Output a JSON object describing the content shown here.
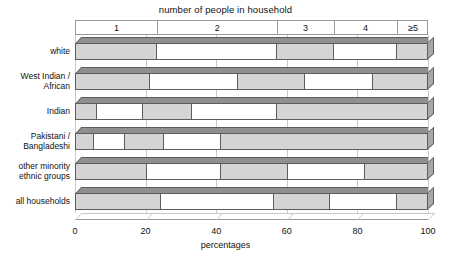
{
  "chart_data": {
    "type": "bar",
    "subtype": "stacked-horizontal-percentage",
    "title": "number of people in household",
    "xlabel": "percentages",
    "ylabel": "",
    "xlim": [
      0,
      100
    ],
    "xticks": [
      0,
      20,
      40,
      60,
      80,
      100
    ],
    "xtick_labels": [
      "0",
      "20",
      "40",
      "60",
      "80",
      "100"
    ],
    "grid": true,
    "legend_position": "top-axis-band",
    "series": [
      {
        "name": "1",
        "values": [
          23,
          21,
          6,
          5,
          20,
          24
        ]
      },
      {
        "name": "2",
        "values": [
          34,
          25,
          13,
          9,
          21,
          32
        ]
      },
      {
        "name": "3",
        "values": [
          16,
          19,
          14,
          11,
          19,
          16
        ]
      },
      {
        "name": "4",
        "values": [
          18,
          19,
          24,
          16,
          22,
          19
        ]
      },
      {
        "name": "≥5",
        "values": [
          9,
          16,
          43,
          59,
          18,
          9
        ]
      }
    ],
    "categories": [
      "white",
      "West Indian / African",
      "Indian",
      "Pakistani / Bangladeshi",
      "other minority ethnic groups",
      "all households"
    ],
    "colors": {
      "fill_segment": "#d4d4d4",
      "empty_segment": "#ffffff",
      "bar_outline": "#5d5d5d",
      "bar_top_face": "#8f8f8f",
      "bar_side_face": "#a8a8a8",
      "gridline": "#c9c9c9",
      "text": "#111111"
    }
  },
  "header": {
    "title": "number of people in household",
    "cells": [
      {
        "label": "1",
        "start": 0,
        "end": 23
      },
      {
        "label": "2",
        "start": 23,
        "end": 57
      },
      {
        "label": "3",
        "start": 57,
        "end": 73
      },
      {
        "label": "4",
        "start": 73,
        "end": 91
      },
      {
        "label": "≥5",
        "start": 91,
        "end": 100
      }
    ]
  },
  "rows": [
    {
      "label_lines": [
        "white"
      ],
      "segments": [
        {
          "value": 23,
          "start": 0,
          "end": 23,
          "filled": true
        },
        {
          "value": 34,
          "start": 23,
          "end": 57,
          "filled": false
        },
        {
          "value": 16,
          "start": 57,
          "end": 73,
          "filled": true
        },
        {
          "value": 18,
          "start": 73,
          "end": 91,
          "filled": false
        },
        {
          "value": 9,
          "start": 91,
          "end": 100,
          "filled": true
        }
      ]
    },
    {
      "label_lines": [
        "West Indian /",
        "African"
      ],
      "segments": [
        {
          "value": 21,
          "start": 0,
          "end": 21,
          "filled": true
        },
        {
          "value": 25,
          "start": 21,
          "end": 46,
          "filled": false
        },
        {
          "value": 19,
          "start": 46,
          "end": 65,
          "filled": true
        },
        {
          "value": 19,
          "start": 65,
          "end": 84,
          "filled": false
        },
        {
          "value": 16,
          "start": 84,
          "end": 100,
          "filled": true
        }
      ]
    },
    {
      "label_lines": [
        "Indian"
      ],
      "segments": [
        {
          "value": 6,
          "start": 0,
          "end": 6,
          "filled": true
        },
        {
          "value": 13,
          "start": 6,
          "end": 19,
          "filled": false
        },
        {
          "value": 14,
          "start": 19,
          "end": 33,
          "filled": true
        },
        {
          "value": 24,
          "start": 33,
          "end": 57,
          "filled": false
        },
        {
          "value": 43,
          "start": 57,
          "end": 100,
          "filled": true
        }
      ]
    },
    {
      "label_lines": [
        "Pakistani /",
        "Bangladeshi"
      ],
      "segments": [
        {
          "value": 5,
          "start": 0,
          "end": 5,
          "filled": true
        },
        {
          "value": 9,
          "start": 5,
          "end": 14,
          "filled": false
        },
        {
          "value": 11,
          "start": 14,
          "end": 25,
          "filled": true
        },
        {
          "value": 16,
          "start": 25,
          "end": 41,
          "filled": false
        },
        {
          "value": 59,
          "start": 41,
          "end": 100,
          "filled": true
        }
      ]
    },
    {
      "label_lines": [
        "other minority",
        "ethnic groups"
      ],
      "segments": [
        {
          "value": 20,
          "start": 0,
          "end": 20,
          "filled": true
        },
        {
          "value": 21,
          "start": 20,
          "end": 41,
          "filled": false
        },
        {
          "value": 19,
          "start": 41,
          "end": 60,
          "filled": true
        },
        {
          "value": 22,
          "start": 60,
          "end": 82,
          "filled": false
        },
        {
          "value": 18,
          "start": 82,
          "end": 100,
          "filled": true
        }
      ]
    },
    {
      "label_lines": [
        "all households"
      ],
      "segments": [
        {
          "value": 24,
          "start": 0,
          "end": 24,
          "filled": true
        },
        {
          "value": 32,
          "start": 24,
          "end": 56,
          "filled": false
        },
        {
          "value": 16,
          "start": 56,
          "end": 72,
          "filled": true
        },
        {
          "value": 19,
          "start": 72,
          "end": 91,
          "filled": false
        },
        {
          "value": 9,
          "start": 91,
          "end": 100,
          "filled": true
        }
      ]
    }
  ],
  "axis": {
    "ticks": [
      "0",
      "20",
      "40",
      "60",
      "80",
      "100"
    ],
    "tick_values": [
      0,
      20,
      40,
      60,
      80,
      100
    ],
    "title": "percentages"
  }
}
